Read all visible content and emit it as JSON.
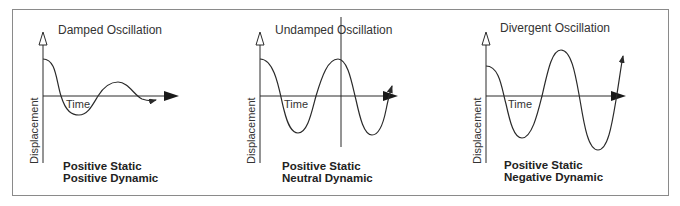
{
  "panels": [
    {
      "title": "Damped Oscillation",
      "x_axis_label": "Time",
      "y_axis_label": "Displacement",
      "stability_static": "Positive Static",
      "stability_dynamic": "Positive Dynamic"
    },
    {
      "title": "Undamped Oscillation",
      "x_axis_label": "Time",
      "y_axis_label": "Displacement",
      "stability_static": "Positive Static",
      "stability_dynamic": "Neutral Dynamic"
    },
    {
      "title": "Divergent Oscillation",
      "x_axis_label": "Time",
      "y_axis_label": "Displacement",
      "stability_static": "Positive Static",
      "stability_dynamic": "Negative Dynamic"
    }
  ],
  "colors": {
    "line": "#2a2a2a",
    "border": "#8a8a8a",
    "background": "#ffffff"
  }
}
